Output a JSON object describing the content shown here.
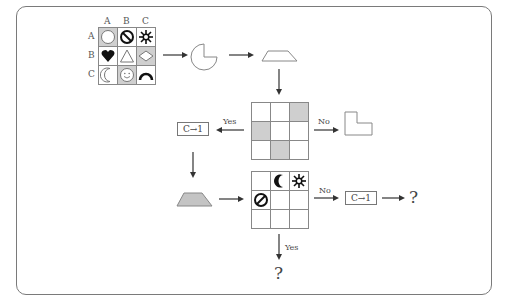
{
  "diagram": {
    "type": "flowchart",
    "top_grid": {
      "column_labels": [
        "A",
        "B",
        "C"
      ],
      "row_labels": [
        "A",
        "B",
        "C"
      ],
      "cells": [
        [
          {
            "icon": "circle-icon",
            "shaded": true
          },
          {
            "icon": "prohibited-icon",
            "shaded": false
          },
          {
            "icon": "sun-icon",
            "shaded": false
          }
        ],
        [
          {
            "icon": "heart-icon",
            "shaded": false
          },
          {
            "icon": "triangle-icon",
            "shaded": false
          },
          {
            "icon": "diamond-icon",
            "shaded": true
          }
        ],
        [
          {
            "icon": "crescent-moon-icon",
            "shaded": false
          },
          {
            "icon": "smiley-icon",
            "shaded": true
          },
          {
            "icon": "arc-icon",
            "shaded": false
          }
        ]
      ]
    },
    "shapes": {
      "pie": "pie-missing-quarter",
      "trapezoid_outline": "trapezoid-outline",
      "trapezoid_filled": "trapezoid-gray",
      "l_shape": "l-shape"
    },
    "middle_grid": {
      "shaded_cells": [
        [
          0,
          2
        ],
        [
          1,
          0
        ],
        [
          2,
          1
        ]
      ]
    },
    "lower_grid": {
      "cells": [
        [
          "",
          "crescent-moon-icon",
          "sun-icon"
        ],
        [
          "prohibited-icon",
          "",
          ""
        ],
        [
          "",
          "",
          ""
        ]
      ]
    },
    "labels": {
      "yes_left": "Yes",
      "no_right": "No",
      "no_lower": "No",
      "yes_bottom": "Yes",
      "rule_box_1": "C→1",
      "rule_box_2": "C→1",
      "question_right": "?",
      "question_bottom": "?"
    },
    "colors": {
      "border": "#7a7a7a",
      "shade": "#cfcfcf",
      "arrow": "#333333"
    }
  }
}
